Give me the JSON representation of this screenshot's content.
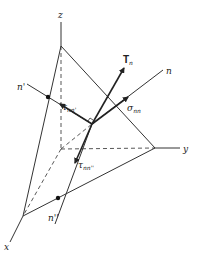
{
  "diagram": {
    "type": "stress-tetrahedron",
    "colors": {
      "line": "#333333",
      "background": "#ffffff"
    },
    "axes": {
      "x": {
        "label": "x"
      },
      "y": {
        "label": "y"
      },
      "z": {
        "label": "z"
      }
    },
    "vectors": {
      "traction": {
        "label": "T",
        "subscript": "n"
      },
      "normal": {
        "label": "n"
      },
      "n_prime": {
        "label": "n'"
      },
      "n_double_prime": {
        "label": "n''"
      }
    },
    "stresses": {
      "normal_stress": {
        "symbol": "σ",
        "subscript": "nn"
      },
      "shear_1": {
        "symbol": "τ",
        "subscript": "nn'"
      },
      "shear_2": {
        "symbol": "τ",
        "subscript": "nn''"
      }
    }
  }
}
